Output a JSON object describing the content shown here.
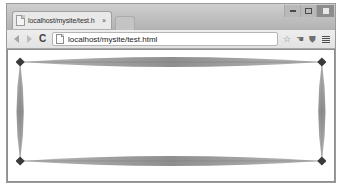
{
  "window": {
    "controls": {
      "minimize_label": "Minimize",
      "maximize_label": "Maximize",
      "close_label": "Close"
    }
  },
  "tabstrip": {
    "tabs": [
      {
        "title": "localhost/mysite/test.h",
        "favicon": "page-icon",
        "close_label": "×"
      }
    ],
    "new_tab_label": ""
  },
  "toolbar": {
    "back_label": "",
    "forward_label": "",
    "reload_label": "C",
    "omnibox": {
      "url": "localhost/mysite/test.html",
      "placeholder": "Search Google or type URL",
      "page_icon": "page-icon"
    },
    "actions": [
      {
        "name": "bookmark-star-icon",
        "glyph": "☆"
      },
      {
        "name": "extension-hand-icon",
        "glyph": "☚"
      },
      {
        "name": "shield-icon",
        "glyph": "⛊"
      }
    ],
    "menu_label": ""
  },
  "page": {
    "title": "test.html",
    "ornament": {
      "description": "Decorative rectangular frame of four tapered lens shapes with diamond corner markers",
      "fill_color": "#9a9a9a",
      "corner_color": "#3a3a3a",
      "corner_count": 4,
      "edge_count": 4
    }
  }
}
